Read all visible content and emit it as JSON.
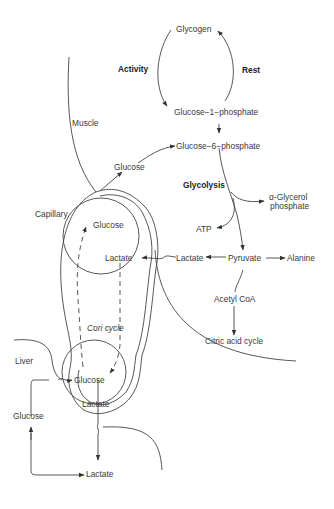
{
  "diagram": {
    "regions": {
      "muscle": "Muscle",
      "capillary": "Capillary",
      "liver": "Liver",
      "cori_cycle": "Cori cycle"
    },
    "cycle_labels": {
      "activity": "Activity",
      "rest": "Rest"
    },
    "nodes": {
      "glycogen": "Glycogen",
      "glucose_1_phosphate": "Glucose−1−phosphate",
      "glucose_6_phosphate": "Glucose−6−phosphate",
      "glucose_muscle": "Glucose",
      "glycolysis": "Glycolysis",
      "alpha_glycerol_1": "α-Glycerol",
      "alpha_glycerol_2": "phosphate",
      "atp": "ATP",
      "pyruvate": "Pyruvate",
      "alanine": "Alanine",
      "lactate_muscle": "Lactate",
      "acetyl_coa": "Acetyl CoA",
      "citric_acid_cycle": "Citric acid cycle",
      "glucose_capillary_top": "Glucose",
      "lactate_capillary_top": "Lactate",
      "glucose_capillary_bottom": "Glucose",
      "lactate_capillary_bottom": "Lactate",
      "glucose_liver": "Glucose",
      "lactate_liver": "Lactate"
    }
  }
}
